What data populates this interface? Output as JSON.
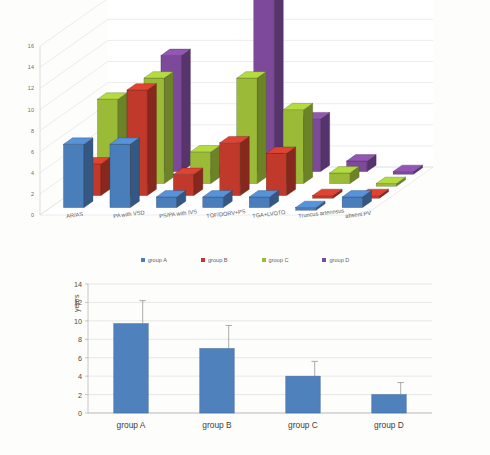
{
  "figure": {
    "panel_count": 2
  },
  "chart_data": [
    {
      "type": "bar",
      "id": "diagnosis-distribution-3d",
      "render": "3d-grouped-bar",
      "title": "",
      "xlabel": "",
      "ylabel": "",
      "ylim": [
        0,
        16
      ],
      "yticks": [
        0,
        2,
        4,
        6,
        8,
        10,
        12,
        14,
        16
      ],
      "ytick_labels": [
        "0",
        "2",
        "4",
        "6",
        "8",
        "10",
        "12",
        "14",
        "16"
      ],
      "grid": true,
      "legend_position": "bottom",
      "categories": [
        "AR/AS",
        "PA with VSD",
        "PS/PA with IVS",
        "TOF/DORV+PS",
        "TGA+LVOTO",
        "Truncus arteriosus",
        "absent PV"
      ],
      "series": [
        {
          "name": "group A",
          "color": "#4A7EBB",
          "values": [
            6,
            6,
            1,
            1,
            1,
            0,
            1
          ]
        },
        {
          "name": "group B",
          "color": "#C0392B",
          "values": [
            3,
            10,
            2,
            5,
            4,
            0,
            0
          ]
        },
        {
          "name": "group C",
          "color": "#9BBB38",
          "values": [
            8,
            10,
            3,
            10,
            7,
            1,
            0
          ]
        },
        {
          "name": "group D",
          "color": "#7D4A9B",
          "values": [
            0,
            11,
            0,
            17,
            5,
            1,
            0
          ]
        }
      ]
    },
    {
      "type": "bar",
      "id": "age-by-group",
      "render": "2d-bar-errorbars",
      "title": "",
      "xlabel": "",
      "ylabel": "years",
      "ylim": [
        0,
        14
      ],
      "yticks": [
        0,
        2,
        4,
        6,
        8,
        10,
        12,
        14
      ],
      "ytick_labels": [
        "0",
        "2",
        "4",
        "6",
        "8",
        "10",
        "12",
        "14"
      ],
      "grid": true,
      "legend_position": "none",
      "bar_color": "#4F81BD",
      "categories": [
        "group A",
        "group B",
        "group C",
        "group D"
      ],
      "values": [
        9.7,
        7.0,
        4.0,
        2.0
      ],
      "error_upper": [
        2.5,
        2.5,
        1.6,
        1.3
      ],
      "error_bar_tops": [
        12.2,
        9.5,
        5.6,
        3.3
      ]
    }
  ]
}
